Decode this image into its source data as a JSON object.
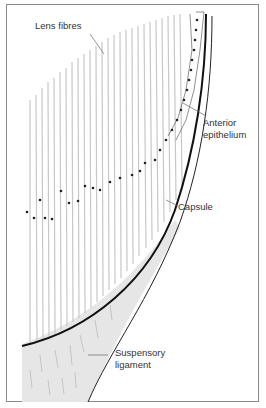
{
  "diagram": {
    "labels": {
      "lens_fibres": "Lens fibres",
      "anterior_epithelium_line1": "Anterior",
      "anterior_epithelium_line2": "epithelium",
      "capsule": "Capsule",
      "suspensory_ligament_line1": "Suspensory",
      "suspensory_ligament_line2": "ligament"
    },
    "colors": {
      "border": "#8a8a8a",
      "capsule_line": "#111111",
      "ligament_fill": "#e6e6e6",
      "fibre_stroke": "#c8c8c8",
      "nucleus": "#222222",
      "text": "#333333"
    }
  }
}
